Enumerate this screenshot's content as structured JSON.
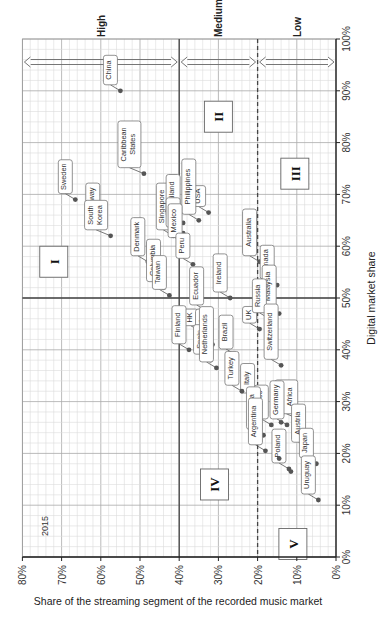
{
  "chart_data": {
    "type": "scatter",
    "orientation": "rotated 90deg clockwise (x-axis drawn along bottom reversed 80%->0%, y-axis drawn along right 0%->100%)",
    "title": "",
    "year_label": "2015",
    "xlabel": "Share of the streaming segment of the recorded music market",
    "ylabel": "Digital market share",
    "xlim": [
      0,
      80
    ],
    "ylim": [
      0,
      100
    ],
    "x_ticks": [
      "80%",
      "70%",
      "60%",
      "50%",
      "40%",
      "30%",
      "20%",
      "10%",
      "0%"
    ],
    "y_ticks": [
      "0%",
      "10%",
      "20%",
      "30%",
      "40%",
      "50%",
      "60%",
      "70%",
      "80%",
      "90%",
      "100%"
    ],
    "grid": true,
    "bands": [
      {
        "label": "High",
        "x_from": 80,
        "x_to": 40
      },
      {
        "label": "Medium",
        "x_from": 40,
        "x_to": 20
      },
      {
        "label": "Low",
        "x_from": 20,
        "x_to": 0
      }
    ],
    "reference_lines": [
      {
        "axis": "x",
        "value": 40,
        "style": "solid"
      },
      {
        "axis": "x",
        "value": 20,
        "style": "dashed"
      },
      {
        "axis": "y",
        "value": 50,
        "style": "solid"
      }
    ],
    "regions": [
      {
        "label": "I",
        "x": 72,
        "y": 57
      },
      {
        "label": "II",
        "x": 30,
        "y": 85
      },
      {
        "label": "III",
        "x": 10.5,
        "y": 74
      },
      {
        "label": "IV",
        "x": 31,
        "y": 14
      },
      {
        "label": "V",
        "x": 11,
        "y": 2.5
      }
    ],
    "points": [
      {
        "name": "China",
        "x": 55,
        "y": 90
      },
      {
        "name": "Caribbean States",
        "x": 49,
        "y": 74
      },
      {
        "name": "Sweden",
        "x": 66.5,
        "y": 69
      },
      {
        "name": "Norway",
        "x": 59.5,
        "y": 64.5
      },
      {
        "name": "South Korea",
        "x": 57.5,
        "y": 62
      },
      {
        "name": "Denmark",
        "x": 48,
        "y": 57
      },
      {
        "name": "Singapore",
        "x": 41.5,
        "y": 62
      },
      {
        "name": "Thailand",
        "x": 39,
        "y": 64.5
      },
      {
        "name": "India",
        "x": 39,
        "y": 62.5
      },
      {
        "name": "USA",
        "x": 32.5,
        "y": 66.5
      },
      {
        "name": "Philippines",
        "x": 35,
        "y": 65
      },
      {
        "name": "Mexico",
        "x": 38.5,
        "y": 60.5
      },
      {
        "name": "Peru",
        "x": 36.5,
        "y": 56.5
      },
      {
        "name": "Ecuador",
        "x": 33,
        "y": 47.5
      },
      {
        "name": "Ireland",
        "x": 27,
        "y": 50
      },
      {
        "name": "Australia",
        "x": 19.5,
        "y": 57
      },
      {
        "name": "Canada",
        "x": 15,
        "y": 52.5
      },
      {
        "name": "Malaysia",
        "x": 14.5,
        "y": 47
      },
      {
        "name": "Columbia",
        "x": 44,
        "y": 52
      },
      {
        "name": "Taiwan",
        "x": 42.5,
        "y": 50.5
      },
      {
        "name": "HK",
        "x": 34.5,
        "y": 43.5
      },
      {
        "name": "Chile",
        "x": 31.5,
        "y": 41
      },
      {
        "name": "Finland",
        "x": 37.5,
        "y": 40
      },
      {
        "name": "Spain",
        "x": 32,
        "y": 38
      },
      {
        "name": "Netherlands",
        "x": 30.5,
        "y": 36.5
      },
      {
        "name": "Brazil",
        "x": 25.5,
        "y": 39
      },
      {
        "name": "UK",
        "x": 19.5,
        "y": 44
      },
      {
        "name": "Russia",
        "x": 17,
        "y": 46
      },
      {
        "name": "Switzerland",
        "x": 14,
        "y": 37
      },
      {
        "name": "Italy",
        "x": 20,
        "y": 30.5
      },
      {
        "name": "Turkey",
        "x": 24,
        "y": 32
      },
      {
        "name": "France",
        "x": 16.5,
        "y": 25.5
      },
      {
        "name": "South Africa",
        "x": 9,
        "y": 26.5
      },
      {
        "name": "Germany",
        "x": 12.5,
        "y": 25.5
      },
      {
        "name": "Slovakia",
        "x": 18.5,
        "y": 23.5
      },
      {
        "name": "Argentina",
        "x": 18,
        "y": 20.5
      },
      {
        "name": "Poland",
        "x": 12,
        "y": 17
      },
      {
        "name": "Austria",
        "x": 7,
        "y": 21
      },
      {
        "name": "Japan",
        "x": 5,
        "y": 18
      },
      {
        "name": "Uruguay",
        "x": 4.5,
        "y": 11
      },
      {
        "name": "",
        "x": 14.5,
        "y": 19
      },
      {
        "name": "",
        "x": 11.5,
        "y": 16.5
      },
      {
        "name": "",
        "x": 14,
        "y": 26
      }
    ]
  },
  "text": {
    "year": "2015",
    "xlabel": "Share of the streaming segment of the recorded music market",
    "ylabel": "Digital market share",
    "band_high": "High",
    "band_medium": "Medium",
    "band_low": "Low"
  }
}
